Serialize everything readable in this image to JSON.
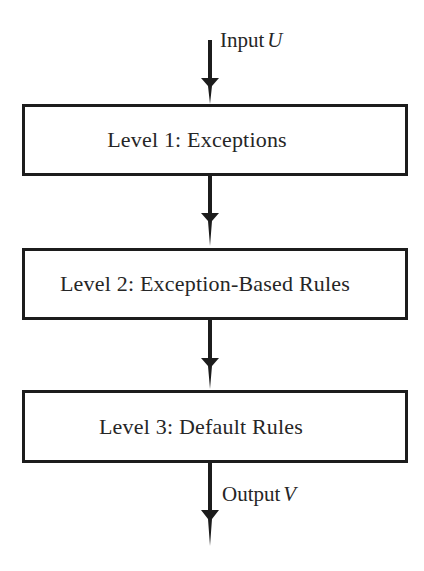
{
  "diagram": {
    "background_color": "#ffffff",
    "line_color": "#1c1c1c",
    "text_color": "#262626",
    "boxes": [
      {
        "id": "level-1",
        "label": "Level 1: Exceptions"
      },
      {
        "id": "level-2",
        "label": "Level 2: Exception-Based Rules"
      },
      {
        "id": "level-3",
        "label": "Level 3: Default Rules"
      }
    ],
    "labels": {
      "input": {
        "text": "Input",
        "variable": "U"
      },
      "output": {
        "text": "Output",
        "variable": "V"
      }
    },
    "arrows": [
      {
        "id": "input-arrow",
        "from": "input",
        "to": "level-1",
        "direction": "down"
      },
      {
        "id": "arrow-1-to-2",
        "from": "level-1",
        "to": "level-2",
        "direction": "down"
      },
      {
        "id": "arrow-2-to-3",
        "from": "level-2",
        "to": "level-3",
        "direction": "down"
      },
      {
        "id": "output-arrow",
        "from": "level-3",
        "to": "output",
        "direction": "down"
      }
    ]
  }
}
